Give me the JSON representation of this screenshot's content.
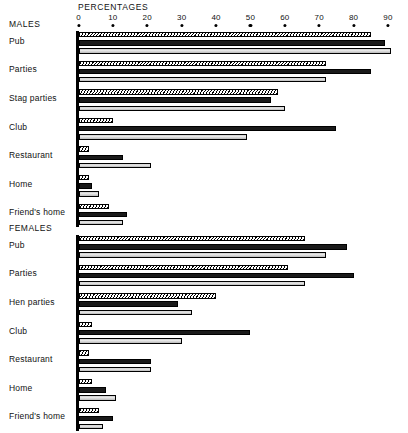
{
  "chart": {
    "axis_title": "PERCENTAGES",
    "ticks": [
      0,
      10,
      20,
      30,
      40,
      50,
      60,
      70,
      80,
      90
    ],
    "groups": [
      {
        "title": "MALES"
      },
      {
        "title": "FEMALES"
      }
    ]
  },
  "chart_data": {
    "type": "bar",
    "title": "PERCENTAGES",
    "xlabel": "PERCENTAGES",
    "ylabel": "",
    "xlim": [
      0,
      90
    ],
    "grid": false,
    "orientation": "horizontal",
    "legend": "none",
    "series_styles": [
      "hatched",
      "solid-black",
      "light-grey"
    ],
    "panels": [
      {
        "name": "MALES",
        "categories": [
          "Pub",
          "Parties",
          "Stag parties",
          "Club",
          "Restaurant",
          "Home",
          "Friend's home"
        ],
        "series": [
          {
            "name": "hatched",
            "values": [
              85,
              72,
              58,
              10,
              3,
              3,
              9
            ]
          },
          {
            "name": "solid-black",
            "values": [
              89,
              85,
              56,
              75,
              13,
              4,
              14
            ]
          },
          {
            "name": "light-grey",
            "values": [
              91,
              72,
              60,
              49,
              21,
              6,
              13
            ]
          }
        ]
      },
      {
        "name": "FEMALES",
        "categories": [
          "Pub",
          "Parties",
          "Hen parties",
          "Club",
          "Restaurant",
          "Home",
          "Friend's home"
        ],
        "series": [
          {
            "name": "hatched",
            "values": [
              66,
              61,
              40,
              4,
              3,
              4,
              6
            ]
          },
          {
            "name": "solid-black",
            "values": [
              78,
              80,
              29,
              50,
              21,
              8,
              10
            ]
          },
          {
            "name": "light-grey",
            "values": [
              72,
              66,
              33,
              30,
              21,
              11,
              7
            ]
          }
        ]
      }
    ]
  },
  "tick_labels": [
    "0",
    "10",
    "20",
    "30",
    "40",
    "50",
    "60",
    "70",
    "80",
    "90"
  ],
  "males": {
    "title": "MALES",
    "labels": [
      "Pub",
      "Parties",
      "Stag parties",
      "Club",
      "Restaurant",
      "Home",
      "Friend's home"
    ]
  },
  "females": {
    "title": "FEMALES",
    "labels": [
      "Pub",
      "Parties",
      "Hen parties",
      "Club",
      "Restaurant",
      "Home",
      "Friend's home"
    ]
  }
}
